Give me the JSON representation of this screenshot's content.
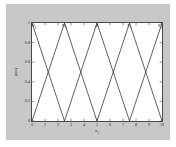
{
  "figure": {
    "background_color": "#c8c8c8",
    "axes_background_color": "#ffffff",
    "axes_edge_color": "#4a4a4a",
    "line_color": "#3a3a3a"
  },
  "chart_data": {
    "type": "line",
    "title": "",
    "xlabel": "x",
    "xlabel_sub": "1",
    "ylabel": "μ(x)",
    "xlim": [
      0,
      10
    ],
    "ylim": [
      0,
      1
    ],
    "grid": false,
    "legend_position": "none",
    "xticks": [
      0,
      1,
      2,
      3,
      4,
      5,
      6,
      7,
      8,
      9,
      10
    ],
    "xticklabels": [
      "0",
      "1",
      "2",
      "3",
      "4",
      "5",
      "6",
      "7",
      "8",
      "9",
      "10"
    ],
    "yticks": [
      0,
      0.2,
      0.4,
      0.6,
      0.8,
      1
    ],
    "yticklabels": [
      "0",
      "0.2",
      "0.4",
      "0.6",
      "0.8",
      "1"
    ],
    "annotations": [
      {
        "text": "N",
        "sub": "2",
        "x": 0.0,
        "y": 1.0
      },
      {
        "text": "N",
        "sub": "1",
        "x": 2.5,
        "y": 1.0
      },
      {
        "text": "Z",
        "sub": "",
        "x": 5.0,
        "y": 1.0
      },
      {
        "text": "P",
        "sub": "1",
        "x": 7.5,
        "y": 1.0
      },
      {
        "text": "P",
        "sub": "2",
        "x": 10.0,
        "y": 1.0
      }
    ],
    "series": [
      {
        "name": "N2",
        "x": [
          0.0,
          2.5
        ],
        "values": [
          1,
          0
        ]
      },
      {
        "name": "N1",
        "x": [
          0.0,
          2.5,
          5.0
        ],
        "values": [
          0,
          1,
          0
        ]
      },
      {
        "name": "Z",
        "x": [
          2.5,
          5.0,
          7.5
        ],
        "values": [
          0,
          1,
          0
        ]
      },
      {
        "name": "P1",
        "x": [
          5.0,
          7.5,
          10.0
        ],
        "values": [
          0,
          1,
          0
        ]
      },
      {
        "name": "P2",
        "x": [
          7.5,
          10.0
        ],
        "values": [
          0,
          1
        ]
      }
    ]
  }
}
